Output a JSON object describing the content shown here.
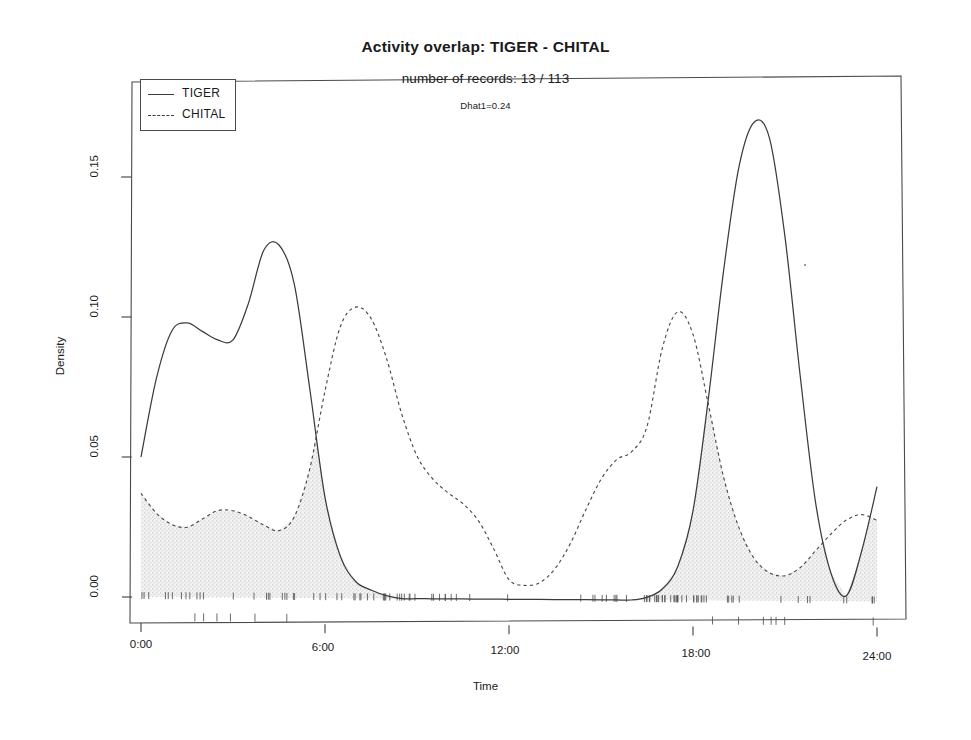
{
  "titles": {
    "main": "Activity overlap:  TIGER - CHITAL",
    "sub": "number of records: 13 / 113",
    "dhat": "Dhat1=0.24"
  },
  "axes": {
    "x_label": "Time",
    "y_label": "Density",
    "x_ticks": [
      "0:00",
      "6:00",
      "12:00",
      "18:00",
      "24:00"
    ],
    "y_ticks": [
      "0.00",
      "0.05",
      "0.10",
      "0.15"
    ]
  },
  "legend": {
    "entries": [
      {
        "label": "TIGER",
        "key": "solid-line-key",
        "style": "solid"
      },
      {
        "label": "CHITAL",
        "key": "dashed-line-key",
        "style": "dashed"
      }
    ]
  },
  "colors": {
    "line": "#3c3c3c",
    "overlap_fill": "#e9e9e9",
    "box": "#4a4a4a",
    "background": "#ffffff"
  },
  "chart_data": {
    "type": "line",
    "title": "Activity overlap:  TIGER - CHITAL",
    "subtitle": "number of records: 13 / 113",
    "annotations": [
      "Dhat1=0.24"
    ],
    "xlabel": "Time",
    "ylabel": "Density",
    "xlim": [
      0,
      24
    ],
    "ylim": [
      0.0,
      0.18
    ],
    "x_tick_values": [
      0,
      6,
      12,
      18,
      24
    ],
    "x_tick_labels": [
      "0:00",
      "6:00",
      "12:00",
      "18:00",
      "24:00"
    ],
    "y_tick_values": [
      0.0,
      0.05,
      0.1,
      0.15
    ],
    "y_tick_labels": [
      "0.00",
      "0.05",
      "0.10",
      "0.15"
    ],
    "grid": false,
    "legend_position": "top-left",
    "overlap_statistic": {
      "name": "Dhat1",
      "value": 0.24
    },
    "record_counts": {
      "TIGER": 13,
      "CHITAL": 113
    },
    "shaded_region": "overlap = pointwise minimum of TIGER and CHITAL densities",
    "x": [
      0.0,
      0.5,
      1.0,
      1.5,
      2.0,
      2.5,
      3.0,
      3.5,
      4.0,
      4.5,
      5.0,
      5.5,
      6.0,
      6.5,
      7.0,
      7.5,
      8.0,
      8.5,
      9.0,
      9.5,
      10.0,
      10.5,
      11.0,
      11.5,
      12.0,
      12.5,
      13.0,
      13.5,
      14.0,
      14.5,
      15.0,
      15.5,
      16.0,
      16.5,
      17.0,
      17.5,
      18.0,
      18.5,
      19.0,
      19.5,
      20.0,
      20.5,
      21.0,
      21.5,
      22.0,
      22.5,
      23.0,
      23.5,
      24.0
    ],
    "series": [
      {
        "name": "TIGER",
        "style": "solid",
        "values": [
          0.05,
          0.078,
          0.095,
          0.098,
          0.095,
          0.092,
          0.092,
          0.105,
          0.124,
          0.126,
          0.112,
          0.075,
          0.036,
          0.015,
          0.006,
          0.003,
          0.001,
          0.0,
          0.0,
          0.0,
          0.0,
          0.0,
          0.0,
          0.0,
          0.0,
          0.0,
          0.0,
          0.0,
          0.0,
          0.0,
          0.0,
          0.0,
          0.0,
          0.001,
          0.004,
          0.012,
          0.032,
          0.072,
          0.118,
          0.155,
          0.171,
          0.165,
          0.13,
          0.08,
          0.035,
          0.01,
          0.002,
          0.018,
          0.041
        ]
      },
      {
        "name": "CHITAL",
        "style": "dashed",
        "values": [
          0.037,
          0.03,
          0.026,
          0.025,
          0.028,
          0.031,
          0.031,
          0.029,
          0.026,
          0.024,
          0.029,
          0.046,
          0.074,
          0.097,
          0.104,
          0.1,
          0.086,
          0.066,
          0.051,
          0.043,
          0.038,
          0.034,
          0.028,
          0.018,
          0.007,
          0.005,
          0.006,
          0.011,
          0.02,
          0.032,
          0.043,
          0.05,
          0.053,
          0.062,
          0.09,
          0.103,
          0.095,
          0.07,
          0.044,
          0.026,
          0.015,
          0.01,
          0.009,
          0.012,
          0.018,
          0.024,
          0.029,
          0.031,
          0.029
        ]
      }
    ],
    "rug_note": "short vertical rug ticks for both species drawn along the baseline"
  }
}
